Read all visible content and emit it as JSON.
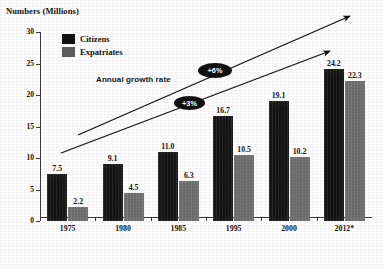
{
  "chart_data": {
    "type": "bar",
    "title": "",
    "ylabel": "Numbers (Millions)",
    "xlabel": "Year",
    "ylim": [
      0,
      30
    ],
    "yticks": [
      0,
      5,
      10,
      15,
      20,
      25,
      30
    ],
    "grid": false,
    "legend_position": "top-left-inside",
    "categories": [
      "1975",
      "1980",
      "1985",
      "1995",
      "2000",
      "2012*"
    ],
    "series": [
      {
        "name": "Citizens",
        "color": "#121212",
        "values": [
          7.5,
          9.1,
          11.0,
          16.7,
          19.1,
          24.2
        ],
        "labels": [
          "7.5",
          "9.1",
          "11.0",
          "16.7",
          "19.1",
          "24.2"
        ]
      },
      {
        "name": "Expatriates",
        "color": "#6f6f6f",
        "values": [
          2.2,
          4.5,
          6.3,
          10.5,
          10.2,
          22.3
        ],
        "labels": [
          "2.2",
          "4.5",
          "6.3",
          "10.5",
          "10.2",
          "22.3"
        ]
      }
    ],
    "annotations": [
      {
        "id": "growth-caption",
        "text": "Annual growth rate"
      },
      {
        "id": "growth-rate-upper",
        "text": "+6%"
      },
      {
        "id": "growth-rate-lower",
        "text": "+3%"
      }
    ],
    "trend_arrows": [
      {
        "id": "upper-trend-arrow",
        "label": "+6%",
        "from": [
          78,
          135
        ],
        "to": [
          350,
          16
        ]
      },
      {
        "id": "lower-trend-arrow",
        "label": "+3%",
        "from": [
          61,
          153
        ],
        "to": [
          330,
          51
        ]
      }
    ]
  }
}
